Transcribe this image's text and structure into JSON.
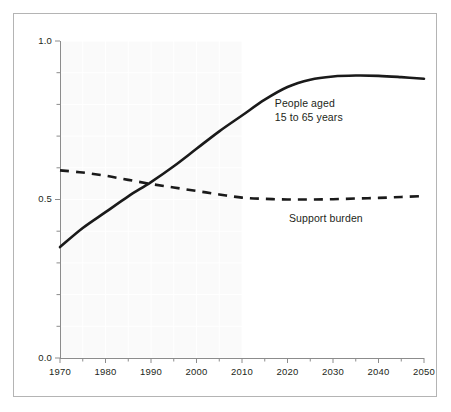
{
  "chart_data": {
    "type": "line",
    "title": "",
    "subtitle": "",
    "xlabel": "",
    "ylabel": "",
    "xlim": [
      1970,
      2050
    ],
    "ylim": [
      0.0,
      1.0
    ],
    "grid": true,
    "grid_note": "faint white gridlines over light-gray shaded historical band",
    "legend_position": "inline-annotations",
    "x_ticks_major": [
      1970,
      1980,
      1990,
      2000,
      2010,
      2020,
      2030,
      2040,
      2050
    ],
    "x_tick_labels": [
      "1970",
      "1980",
      "1990",
      "2000",
      "2010",
      "2020",
      "2030",
      "2040",
      "2050"
    ],
    "x_ticks_minor_step": 5,
    "y_ticks_major": [
      0.0,
      0.5,
      1.0
    ],
    "y_tick_labels": [
      "0.0",
      "0.5",
      "1.0"
    ],
    "y_ticks_minor_step": 0.1,
    "shaded_region": {
      "from": 1970,
      "to": 2010,
      "color": "#fafafa",
      "label": ""
    },
    "x": [
      1970,
      1975,
      1980,
      1985,
      1990,
      1995,
      2000,
      2005,
      2010,
      2015,
      2020,
      2025,
      2030,
      2035,
      2040,
      2045,
      2050
    ],
    "series": [
      {
        "name": "People aged 15 to 65 years",
        "style": "solid",
        "color": "#1a1a1a",
        "values": [
          0.35,
          0.41,
          0.46,
          0.51,
          0.555,
          0.605,
          0.66,
          0.715,
          0.765,
          0.815,
          0.855,
          0.878,
          0.888,
          0.891,
          0.89,
          0.886,
          0.881
        ]
      },
      {
        "name": "Support burden",
        "style": "dashed",
        "color": "#1a1a1a",
        "values": [
          0.592,
          0.585,
          0.575,
          0.562,
          0.549,
          0.538,
          0.527,
          0.516,
          0.506,
          0.502,
          0.5,
          0.5,
          0.501,
          0.503,
          0.505,
          0.508,
          0.511
        ]
      }
    ],
    "annotations": [
      {
        "name": "people-aged-label",
        "lines": [
          "People aged",
          "15 to 65 years"
        ],
        "at_x": 2026,
        "at_y": 0.8
      },
      {
        "name": "support-burden-label",
        "lines": [
          "Support burden"
        ],
        "at_x": 2030,
        "at_y": 0.44
      }
    ]
  },
  "labels": {
    "y": [
      "1.0",
      "0.5",
      "0.0"
    ],
    "x": [
      "1970",
      "1980",
      "1990",
      "2000",
      "2010",
      "2020",
      "2030",
      "2040",
      "2050"
    ],
    "annot_people_line1": "People aged",
    "annot_people_line2": "15 to 65 years",
    "annot_support": "Support burden"
  },
  "colors": {
    "frame": "#b4b4b4",
    "axis": "#8c8c8c",
    "line": "#1a1a1a",
    "text": "#231f20",
    "shade": "#fafafa",
    "grid": "#ffffff",
    "background": "#ffffff"
  }
}
